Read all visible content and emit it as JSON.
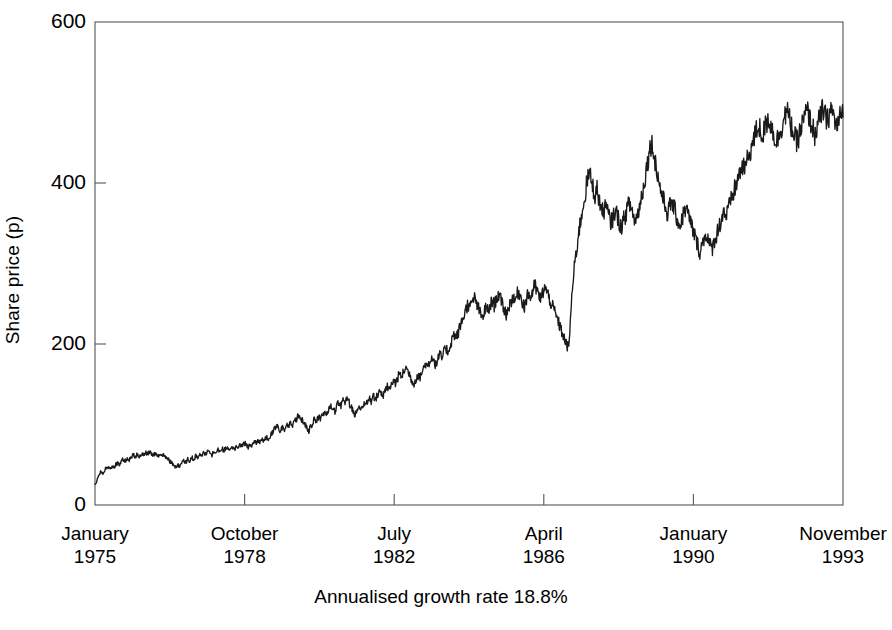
{
  "chart_data": {
    "type": "line",
    "title": "",
    "subtitle": "Annualised growth rate 18.8%",
    "xlabel": "",
    "ylabel": "Share price (p)",
    "ylim": [
      0,
      600
    ],
    "yticks": [
      0,
      200,
      400,
      600
    ],
    "ytick_labels": [
      "0",
      "200",
      "400",
      "600"
    ],
    "grid": false,
    "legend": "none",
    "line_color": "#1a1a1a",
    "xtick_labels": [
      {
        "month": "January",
        "year": "1975"
      },
      {
        "month": "October",
        "year": "1978"
      },
      {
        "month": "July",
        "year": "1982"
      },
      {
        "month": "April",
        "year": "1986"
      },
      {
        "month": "January",
        "year": "1990"
      },
      {
        "month": "November",
        "year": "1993"
      }
    ],
    "x_start": "January 1975",
    "x_end": "November 1993",
    "annualised_growth_rate": "18.8%",
    "series": [
      {
        "name": "Share price (p)",
        "units": "p",
        "values": [
          24,
          30,
          38,
          42,
          40,
          44,
          47,
          45,
          48,
          46,
          49,
          52,
          50,
          54,
          57,
          55,
          58,
          56,
          59,
          62,
          60,
          63,
          61,
          64,
          62,
          65,
          63,
          66,
          64,
          62,
          65,
          63,
          61,
          64,
          62,
          60,
          58,
          55,
          52,
          49,
          47,
          50,
          48,
          52,
          55,
          53,
          57,
          55,
          59,
          57,
          61,
          59,
          63,
          61,
          65,
          63,
          67,
          65,
          62,
          66,
          64,
          68,
          66,
          70,
          68,
          72,
          70,
          67,
          71,
          69,
          73,
          71,
          75,
          73,
          77,
          75,
          72,
          76,
          74,
          78,
          76,
          80,
          78,
          82,
          80,
          84,
          82,
          86,
          90,
          95,
          100,
          96,
          92,
          97,
          94,
          99,
          96,
          101,
          98,
          103,
          107,
          112,
          108,
          104,
          100,
          96,
          92,
          97,
          103,
          108,
          104,
          110,
          106,
          112,
          118,
          114,
          120,
          125,
          121,
          117,
          123,
          128,
          124,
          130,
          126,
          132,
          128,
          122,
          117,
          112,
          118,
          124,
          120,
          126,
          122,
          128,
          133,
          129,
          135,
          131,
          137,
          143,
          139,
          135,
          141,
          147,
          143,
          149,
          155,
          151,
          157,
          163,
          159,
          165,
          171,
          167,
          162,
          156,
          150,
          156,
          162,
          158,
          164,
          170,
          176,
          172,
          178,
          185,
          180,
          174,
          180,
          187,
          182,
          189,
          196,
          190,
          197,
          205,
          213,
          207,
          213,
          221,
          228,
          236,
          243,
          250,
          244,
          251,
          258,
          252,
          245,
          238,
          232,
          239,
          246,
          240,
          247,
          254,
          248,
          255,
          262,
          256,
          250,
          243,
          237,
          244,
          251,
          258,
          252,
          259,
          266,
          260,
          253,
          247,
          255,
          263,
          257,
          265,
          273,
          267,
          261,
          255,
          263,
          271,
          265,
          259,
          252,
          246,
          240,
          233,
          226,
          219,
          212,
          205,
          198,
          195,
          240,
          275,
          300,
          320,
          340,
          355,
          370,
          385,
          400,
          412,
          405,
          395,
          385,
          392,
          380,
          370,
          362,
          372,
          365,
          358,
          350,
          358,
          366,
          360,
          352,
          345,
          352,
          360,
          368,
          375,
          368,
          360,
          352,
          360,
          370,
          382,
          395,
          410,
          425,
          440,
          450,
          440,
          425,
          410,
          398,
          388,
          378,
          370,
          362,
          370,
          378,
          370,
          362,
          354,
          346,
          354,
          362,
          370,
          362,
          354,
          346,
          338,
          330,
          322,
          315,
          322,
          330,
          338,
          330,
          322,
          318,
          326,
          334,
          342,
          350,
          358,
          366,
          358,
          366,
          374,
          382,
          390,
          398,
          406,
          414,
          422,
          416,
          424,
          432,
          440,
          448,
          456,
          464,
          472,
          466,
          458,
          466,
          474,
          482,
          474,
          466,
          458,
          450,
          458,
          466,
          474,
          482,
          490,
          482,
          474,
          466,
          458,
          450,
          458,
          466,
          474,
          482,
          490,
          484,
          476,
          468,
          460,
          468,
          476,
          484,
          492,
          484,
          476,
          484,
          492,
          485,
          477,
          469,
          477,
          485,
          492
        ]
      }
    ]
  },
  "axes": {
    "y_title": "Share price (p)",
    "subtitle": "Annualised growth rate 18.8%"
  }
}
